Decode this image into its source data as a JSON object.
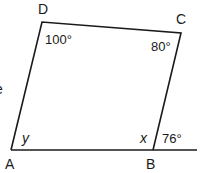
{
  "diagram": {
    "type": "quadrilateral with extended base",
    "colors": {
      "stroke": "#1a1a1a",
      "background": "#ffffff"
    },
    "vertices": {
      "A": {
        "label": "A",
        "x": 11,
        "y": 150
      },
      "B": {
        "label": "B",
        "x": 153,
        "y": 150
      },
      "C": {
        "label": "C",
        "x": 181,
        "y": 33
      },
      "D": {
        "label": "D",
        "x": 42,
        "y": 22
      }
    },
    "extension_end": {
      "x": 197,
      "y": 150
    },
    "angles": {
      "D": "100°",
      "C": "80°",
      "A": "y",
      "B_interior": "x",
      "B_exterior": "76°"
    },
    "cut_off_text": "e"
  }
}
